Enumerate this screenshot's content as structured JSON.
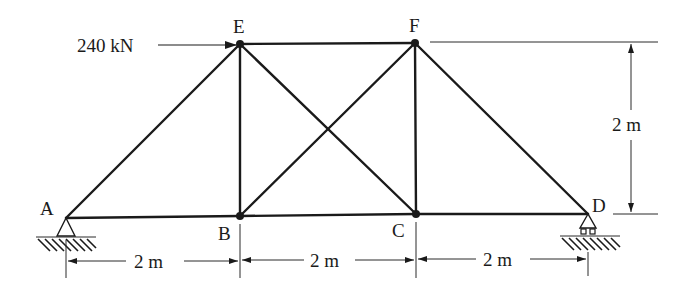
{
  "diagram": {
    "type": "truss",
    "nodes": [
      {
        "id": "A",
        "label": "A",
        "x": 66,
        "y": 218
      },
      {
        "id": "B",
        "label": "B",
        "x": 240,
        "y": 216
      },
      {
        "id": "C",
        "label": "C",
        "x": 416,
        "y": 214
      },
      {
        "id": "D",
        "label": "D",
        "x": 588,
        "y": 214
      },
      {
        "id": "E",
        "label": "E",
        "x": 240,
        "y": 44
      },
      {
        "id": "F",
        "label": "F",
        "x": 415,
        "y": 43
      }
    ],
    "members": [
      "AB",
      "BC",
      "CD",
      "AE",
      "EF",
      "FD",
      "EB",
      "FC",
      "EC",
      "BF"
    ],
    "supports": {
      "A": "pin",
      "D": "roller"
    },
    "load": {
      "node": "E",
      "label": "240 kN",
      "direction": "right"
    },
    "dimensions": {
      "horizontal": [
        "2 m",
        "2 m",
        "2 m"
      ],
      "vertical": "2 m"
    },
    "colors": {
      "line": "#1a1a1a",
      "background": "#ffffff"
    }
  }
}
